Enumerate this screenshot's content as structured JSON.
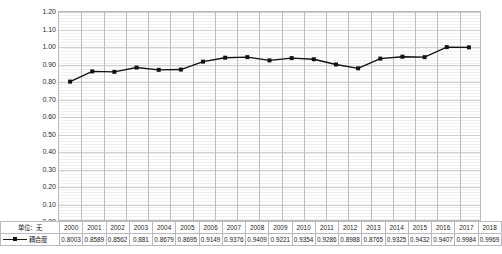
{
  "chart_data": {
    "type": "line",
    "title": "",
    "xlabel": "",
    "ylabel": "",
    "unit_label": "单位：无",
    "grid": true,
    "legend_position": "table-left",
    "ylim": [
      0.0,
      1.2
    ],
    "ytick_labels": [
      "1.20",
      "1.10",
      "1.00",
      "0.90",
      "0.80",
      "0.70",
      "0.60",
      "0.50",
      "0.40",
      "0.30",
      "0.20",
      "0.10",
      "0.00"
    ],
    "ytick_values": [
      1.2,
      1.1,
      1.0,
      0.9,
      0.8,
      0.7,
      0.6,
      0.5,
      0.4,
      0.3,
      0.2,
      0.1,
      0.0
    ],
    "categories": [
      "2000",
      "2001",
      "2002",
      "2003",
      "2004",
      "2005",
      "2006",
      "2007",
      "2008",
      "2009",
      "2010",
      "2011",
      "2012",
      "2013",
      "2014",
      "2015",
      "2016",
      "2017",
      "2018"
    ],
    "series": [
      {
        "name": "耦合度",
        "color": "#111111",
        "marker": "square",
        "values": [
          0.8003,
          0.8589,
          0.8562,
          0.881,
          0.8679,
          0.8695,
          0.9149,
          0.9376,
          0.9409,
          0.9221,
          0.9354,
          0.9286,
          0.8988,
          0.8765,
          0.9325,
          0.9432,
          0.9407,
          0.9984,
          0.9969
        ],
        "value_labels": [
          "0.8003",
          "0.8589",
          "0.8562",
          "0.881",
          "0.8679",
          "0.8695",
          "0.9149",
          "0.9376",
          "0.9409",
          "0.9221",
          "0.9354",
          "0.9286",
          "0.8988",
          "0.8765",
          "0.9325",
          "0.9432",
          "0.9407",
          "0.9984",
          "0.9969"
        ]
      }
    ]
  },
  "table": {
    "corner_label": "单位：无",
    "legend_label": "耦合度"
  }
}
